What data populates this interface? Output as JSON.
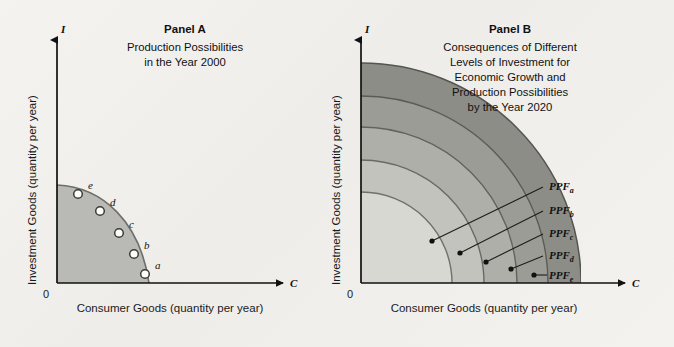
{
  "figure": {
    "background_color": "#f1f0ec",
    "panels": [
      {
        "id": "panel-a",
        "title": "Panel A",
        "subtitle_lines": [
          "Production Possibilities",
          "in the Year 2000"
        ],
        "y_axis_label": "Investment Goods (quantity per year)",
        "x_axis_label": "Consumer Goods (quantity per year)",
        "y_axis_symbol": "I",
        "x_axis_symbol": "C",
        "origin_label": "0",
        "region_fill": "#b9b9b5",
        "curve_color": "#6f6f6b",
        "points": [
          {
            "label": "e",
            "x": 78,
            "y": 194
          },
          {
            "label": "d",
            "x": 100,
            "y": 211
          },
          {
            "label": "c",
            "x": 119,
            "y": 233
          },
          {
            "label": "b",
            "x": 134,
            "y": 254
          },
          {
            "label": "a",
            "x": 145,
            "y": 274
          }
        ]
      },
      {
        "id": "panel-b",
        "title": "Panel B",
        "subtitle_lines": [
          "Consequences of Different",
          "Levels of Investment for",
          "Economic Growth and",
          "Production Possibilities",
          "by the Year 2020"
        ],
        "y_axis_label": "Investment Goods (quantity per year)",
        "x_axis_label": "Consumer Goods (quantity per year)",
        "y_axis_symbol": "I",
        "x_axis_symbol": "C",
        "origin_label": "0",
        "curves": [
          {
            "label": "PPF",
            "subscript": "a",
            "fill": "#8d8d88",
            "radius": 180
          },
          {
            "label": "PPF",
            "subscript": "b",
            "fill": "#9b9b96",
            "radius": 156
          },
          {
            "label": "PPF",
            "subscript": "c",
            "fill": "#aeaea9",
            "radius": 132
          },
          {
            "label": "PPF",
            "subscript": "d",
            "fill": "#c2c2bd",
            "radius": 108
          },
          {
            "label": "PPF",
            "subscript": "e",
            "fill": "#d6d6d1",
            "radius": 84
          }
        ]
      }
    ]
  }
}
